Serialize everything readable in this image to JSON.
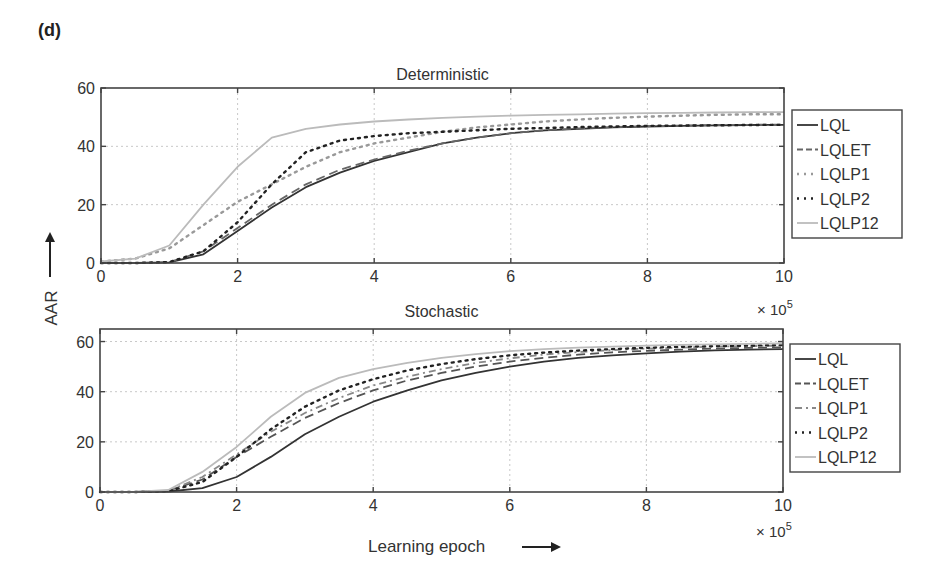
{
  "figure": {
    "panel_label": "(d)",
    "ylabel": "AAR",
    "xlabel": "Learning epoch",
    "x_multiplier": "× 10",
    "x_multiplier_exp": "5"
  },
  "chart_data": [
    {
      "type": "line",
      "title": "Deterministic",
      "xlabel": "Learning epoch (× 10^5)",
      "ylabel": "AAR",
      "xlim": [
        0,
        10
      ],
      "ylim": [
        0,
        60
      ],
      "xticks": [
        0,
        2,
        4,
        6,
        8,
        10
      ],
      "yticks": [
        0,
        20,
        40,
        60
      ],
      "grid": true,
      "legend_position": "outside right",
      "x": [
        0,
        0.5,
        1,
        1.5,
        2,
        2.5,
        3,
        3.5,
        4,
        4.5,
        5,
        5.5,
        6,
        6.5,
        7,
        7.5,
        8,
        8.5,
        9,
        9.5,
        10
      ],
      "series": [
        {
          "name": "LQL",
          "style": "solid",
          "color": "#333333",
          "values": [
            0,
            0,
            0.2,
            3,
            11,
            19,
            26,
            31,
            35,
            38,
            41,
            43,
            44.5,
            45.5,
            46,
            46.5,
            46.8,
            47,
            47.2,
            47.3,
            47.4
          ]
        },
        {
          "name": "LQLET",
          "style": "dashed",
          "color": "#666666",
          "values": [
            0,
            0,
            0.3,
            4,
            12,
            20,
            27,
            32,
            35.5,
            38.5,
            41,
            43,
            44.5,
            45.5,
            46.2,
            46.6,
            46.9,
            47.1,
            47.3,
            47.4,
            47.5
          ]
        },
        {
          "name": "LQLP1",
          "style": "dotted",
          "color": "#999999",
          "values": [
            0.5,
            1.5,
            5,
            13,
            21,
            27,
            33,
            38,
            41,
            43,
            45,
            46.5,
            47.5,
            48.5,
            49.2,
            49.8,
            50.2,
            50.5,
            50.8,
            51,
            51
          ]
        },
        {
          "name": "LQLP2",
          "style": "dotted",
          "color": "#222222",
          "values": [
            0,
            0,
            0.3,
            4,
            14,
            27,
            38,
            42,
            43.5,
            44.5,
            45,
            45.5,
            46,
            46.3,
            46.6,
            46.8,
            47,
            47.1,
            47.2,
            47.3,
            47.4
          ]
        },
        {
          "name": "LQLP12",
          "style": "solid",
          "color": "#bbbbbb",
          "values": [
            0.5,
            1.5,
            6,
            20,
            33,
            43,
            46,
            47.5,
            48.5,
            49.2,
            49.8,
            50.2,
            50.5,
            50.8,
            51,
            51.2,
            51.4,
            51.5,
            51.6,
            51.7,
            51.7
          ]
        }
      ]
    },
    {
      "type": "line",
      "title": "Stochastic",
      "xlabel": "Learning epoch (× 10^5)",
      "ylabel": "AAR",
      "xlim": [
        0,
        10
      ],
      "ylim": [
        0,
        65
      ],
      "xticks": [
        0,
        2,
        4,
        6,
        8,
        10
      ],
      "yticks": [
        0,
        20,
        40,
        60
      ],
      "grid": true,
      "legend_position": "outside right",
      "x": [
        0,
        0.5,
        1,
        1.5,
        2,
        2.5,
        3,
        3.5,
        4,
        4.5,
        5,
        5.5,
        6,
        6.5,
        7,
        7.5,
        8,
        8.5,
        9,
        9.5,
        10
      ],
      "series": [
        {
          "name": "LQL",
          "style": "solid",
          "color": "#333333",
          "values": [
            0,
            0,
            0.2,
            1.5,
            6,
            14,
            23,
            30,
            36,
            40.5,
            44.5,
            47.5,
            50,
            52,
            53.5,
            54.5,
            55.3,
            56,
            56.5,
            56.8,
            57
          ]
        },
        {
          "name": "LQLET",
          "style": "dashed",
          "color": "#555555",
          "values": [
            0,
            0,
            0.5,
            5,
            14,
            22,
            29.5,
            35.5,
            40.5,
            44.5,
            47.5,
            50,
            52,
            53.5,
            54.8,
            55.7,
            56.3,
            56.8,
            57.2,
            57.5,
            57.7
          ]
        },
        {
          "name": "LQLP1",
          "style": "dash-dot",
          "color": "#888888",
          "values": [
            0,
            0,
            0.5,
            6,
            15,
            24,
            31.5,
            37.5,
            42.5,
            46,
            49,
            51.5,
            53.3,
            54.8,
            55.8,
            56.6,
            57.2,
            57.6,
            58,
            58.2,
            58.4
          ]
        },
        {
          "name": "LQLP2",
          "style": "dotted",
          "color": "#222222",
          "values": [
            0,
            0,
            0.3,
            4,
            14,
            25,
            34,
            40.5,
            45,
            48.5,
            51,
            53,
            54.5,
            55.6,
            56.4,
            57,
            57.5,
            57.9,
            58.2,
            58.4,
            58.6
          ]
        },
        {
          "name": "LQLP12",
          "style": "solid",
          "color": "#bbbbbb",
          "values": [
            0,
            0,
            0.8,
            8,
            18,
            30,
            39.5,
            45.5,
            49,
            51.5,
            53.5,
            55,
            56.2,
            57,
            57.6,
            58,
            58.4,
            58.7,
            58.9,
            59.1,
            59.2
          ]
        }
      ]
    }
  ]
}
